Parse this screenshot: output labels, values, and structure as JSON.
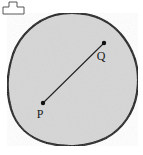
{
  "figure": {
    "background_color": "#ffffff",
    "region": {
      "name": "convex-blob",
      "fill_color": "#d6d6d6",
      "stroke_color": "#111111",
      "stroke_width": 2.2,
      "path": "M 72 13 C 95 13 112 22 124 38 C 136 54 140 74 137 93 C 134 112 123 129 106 138 C 88 147 66 148 47 143 C 29 138 16 126 11 109 C 6 92 7 72 13 54 C 20 35 36 20 55 15 C 60 13.8 66 13 72 13 Z"
    },
    "segment": {
      "name": "segment-PQ",
      "stroke_color": "#222222",
      "stroke_width": 1.1,
      "from": {
        "x": 43,
        "y": 103
      },
      "to": {
        "x": 104,
        "y": 43
      }
    },
    "points": [
      {
        "id": "P",
        "label": "P",
        "marker_x": 43,
        "marker_y": 103,
        "label_x": 40,
        "label_y": 118,
        "radius": 2.2,
        "color": "#111111"
      },
      {
        "id": "Q",
        "label": "Q",
        "marker_x": 104,
        "marker_y": 43,
        "label_x": 101,
        "label_y": 60,
        "radius": 2.2,
        "color": "#111111"
      }
    ],
    "corner_icon": {
      "name": "t-shape-icon",
      "stroke_color": "#555555",
      "fill_color": "#ffffff",
      "stroke_width": 1,
      "path": "M 9 2 L 17 2 L 17 7 L 24 7 L 24 14 L 3 14 L 3 7 L 9 7 Z"
    }
  }
}
